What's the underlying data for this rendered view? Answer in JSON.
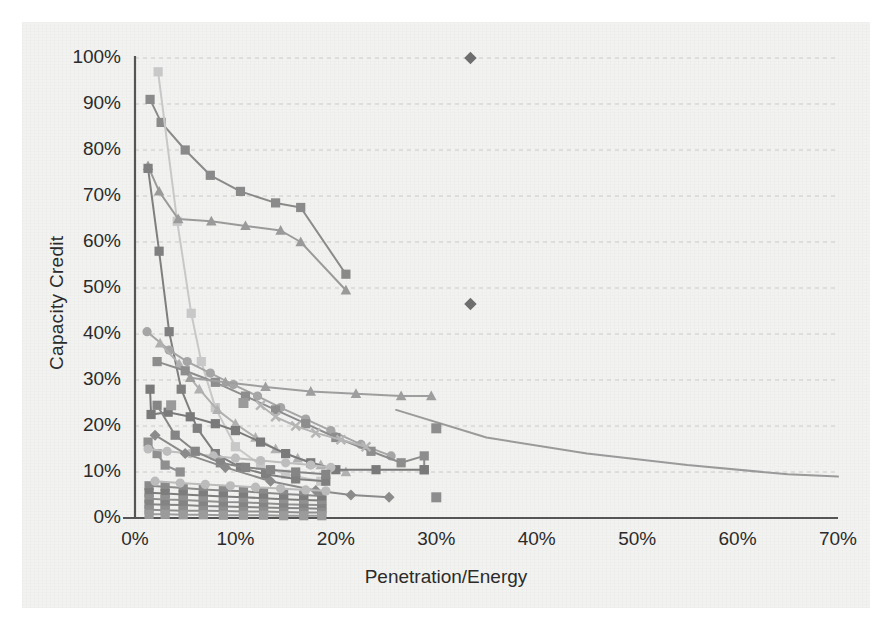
{
  "chart_data": {
    "type": "line",
    "title": "",
    "xlabel": "Penetration/Energy",
    "ylabel": "Capacity Credit",
    "xlim": [
      0,
      70
    ],
    "ylim": [
      0,
      100
    ],
    "xticks": [
      "0%",
      "10%",
      "20%",
      "30%",
      "40%",
      "50%",
      "60%",
      "70%"
    ],
    "yticks": [
      "0%",
      "10%",
      "20%",
      "30%",
      "40%",
      "50%",
      "60%",
      "70%",
      "80%",
      "90%",
      "100%"
    ],
    "grid": "horizontal-dashed",
    "legend": "none",
    "marker_shapes": [
      "square",
      "triangle",
      "circle",
      "diamond",
      "x"
    ],
    "series": [
      {
        "name": "series-01-square-dark",
        "marker": "square",
        "color": "#8a8a8a",
        "points": [
          [
            1.5,
            91.0
          ],
          [
            2.6,
            86.0
          ],
          [
            5.0,
            80.0
          ],
          [
            7.5,
            74.5
          ],
          [
            10.5,
            71.0
          ],
          [
            14.0,
            68.5
          ],
          [
            16.5,
            67.5
          ],
          [
            21.0,
            53.0
          ]
        ]
      },
      {
        "name": "series-02-square-light",
        "marker": "square",
        "color": "#c8c8c8",
        "points": [
          [
            2.3,
            97.0
          ],
          [
            4.2,
            64.5
          ],
          [
            5.6,
            44.5
          ],
          [
            6.6,
            34.0
          ],
          [
            8.0,
            24.0
          ],
          [
            10.0,
            15.5
          ],
          [
            12.5,
            11.5
          ],
          [
            15.0,
            9.5
          ],
          [
            18.5,
            8.0
          ]
        ]
      },
      {
        "name": "series-03-triangle-dark",
        "marker": "triangle",
        "color": "#9a9a9a",
        "points": [
          [
            1.3,
            76.5
          ],
          [
            2.4,
            71.0
          ],
          [
            4.3,
            65.0
          ],
          [
            7.6,
            64.5
          ],
          [
            11.0,
            63.5
          ],
          [
            14.5,
            62.5
          ],
          [
            16.5,
            60.0
          ],
          [
            21.0,
            49.5
          ]
        ]
      },
      {
        "name": "series-04-square-steep",
        "marker": "square",
        "color": "#7f7f7f",
        "points": [
          [
            1.3,
            76.0
          ],
          [
            2.4,
            58.0
          ],
          [
            3.4,
            40.5
          ],
          [
            4.6,
            28.0
          ],
          [
            6.2,
            19.5
          ],
          [
            8.0,
            14.0
          ],
          [
            10.5,
            11.0
          ],
          [
            13.0,
            9.5
          ],
          [
            16.0,
            8.5
          ],
          [
            19.0,
            8.0
          ]
        ]
      },
      {
        "name": "series-05-circle-gray",
        "marker": "circle",
        "color": "#a5a5a5",
        "points": [
          [
            1.2,
            40.5
          ],
          [
            3.4,
            36.5
          ],
          [
            5.2,
            34.0
          ],
          [
            7.5,
            31.5
          ],
          [
            9.8,
            29.0
          ],
          [
            12.2,
            26.5
          ],
          [
            14.5,
            24.0
          ],
          [
            17.0,
            21.5
          ],
          [
            19.5,
            19.0
          ],
          [
            22.5,
            16.0
          ],
          [
            25.5,
            13.5
          ]
        ]
      },
      {
        "name": "series-06-triangle-mid",
        "marker": "triangle",
        "color": "#b0b0b0",
        "points": [
          [
            2.5,
            38.0
          ],
          [
            4.4,
            33.5
          ],
          [
            6.4,
            28.0
          ],
          [
            8.2,
            23.5
          ],
          [
            10.0,
            20.5
          ],
          [
            12.0,
            17.5
          ],
          [
            14.0,
            15.0
          ],
          [
            16.2,
            13.0
          ],
          [
            18.5,
            11.5
          ],
          [
            21.0,
            10.0
          ]
        ]
      },
      {
        "name": "series-07-square-mid",
        "marker": "square",
        "color": "#8d8d8d",
        "points": [
          [
            2.2,
            34.0
          ],
          [
            5.0,
            32.0
          ],
          [
            8.0,
            29.5
          ],
          [
            11.0,
            26.5
          ],
          [
            14.0,
            23.5
          ],
          [
            17.0,
            20.5
          ],
          [
            20.0,
            17.5
          ],
          [
            23.5,
            14.5
          ],
          [
            26.5,
            12.0
          ],
          [
            28.8,
            13.5
          ],
          [
            28.8,
            10.5
          ]
        ]
      },
      {
        "name": "series-08-square-steepdrop",
        "marker": "square",
        "color": "#7a7a7a",
        "points": [
          [
            1.5,
            28.0
          ],
          [
            1.6,
            22.5
          ],
          [
            3.3,
            23.0
          ],
          [
            5.5,
            22.0
          ],
          [
            8.0,
            20.5
          ],
          [
            10.0,
            19.0
          ],
          [
            12.5,
            16.5
          ],
          [
            15.0,
            14.0
          ],
          [
            17.5,
            12.0
          ],
          [
            20.0,
            10.5
          ],
          [
            24.0,
            10.5
          ],
          [
            28.8,
            10.5
          ]
        ]
      },
      {
        "name": "series-09-short-square",
        "marker": "square",
        "color": "#8f8f8f",
        "points": [
          [
            1.3,
            16.5
          ],
          [
            2.2,
            14.0
          ],
          [
            3.0,
            11.5
          ],
          [
            4.5,
            10.0
          ]
        ]
      },
      {
        "name": "series-10-circle-light",
        "marker": "circle",
        "color": "#bdbdbd",
        "points": [
          [
            1.3,
            15.0
          ],
          [
            3.2,
            14.5
          ],
          [
            5.5,
            14.0
          ],
          [
            7.8,
            13.5
          ],
          [
            10.0,
            13.0
          ],
          [
            12.5,
            12.5
          ],
          [
            15.0,
            12.0
          ],
          [
            17.5,
            11.5
          ],
          [
            19.5,
            11.0
          ]
        ]
      },
      {
        "name": "series-11-square-flat",
        "marker": "square",
        "color": "#858585",
        "points": [
          [
            2.2,
            24.5
          ],
          [
            4.0,
            18.0
          ],
          [
            6.0,
            14.5
          ],
          [
            8.5,
            12.0
          ],
          [
            11.0,
            11.0
          ],
          [
            13.5,
            10.5
          ],
          [
            16.0,
            10.0
          ],
          [
            19.0,
            9.5
          ]
        ]
      },
      {
        "name": "series-12-triangle-long",
        "marker": "triangle",
        "color": "#9e9e9e",
        "points": [
          [
            5.5,
            30.5
          ],
          [
            9.0,
            29.5
          ],
          [
            13.0,
            28.5
          ],
          [
            17.5,
            27.5
          ],
          [
            22.0,
            27.0
          ],
          [
            26.5,
            26.5
          ],
          [
            29.5,
            26.5
          ]
        ]
      },
      {
        "name": "series-13-line-long-tail",
        "marker": "none",
        "color": "#9a9a9a",
        "points": [
          [
            26.0,
            23.5
          ],
          [
            35.0,
            17.5
          ],
          [
            45.0,
            14.0
          ],
          [
            55.0,
            11.5
          ],
          [
            65.0,
            9.5
          ],
          [
            70.0,
            9.0
          ]
        ]
      },
      {
        "name": "series-14-diamond-mid",
        "marker": "diamond",
        "color": "#8b8b8b",
        "points": [
          [
            2.0,
            18.0
          ],
          [
            5.0,
            14.0
          ],
          [
            9.0,
            11.0
          ],
          [
            13.5,
            8.0
          ],
          [
            18.0,
            6.0
          ],
          [
            21.5,
            5.0
          ],
          [
            25.3,
            4.5
          ]
        ]
      },
      {
        "name": "series-15-dense-a",
        "marker": "square",
        "color": "#8a8a8a",
        "points": [
          [
            1.4,
            7.0
          ],
          [
            3.0,
            6.8
          ],
          [
            4.8,
            6.5
          ],
          [
            6.8,
            6.2
          ],
          [
            8.8,
            6.0
          ],
          [
            10.8,
            5.8
          ],
          [
            12.8,
            5.5
          ],
          [
            14.8,
            5.2
          ],
          [
            16.8,
            5.0
          ],
          [
            18.6,
            4.8
          ]
        ]
      },
      {
        "name": "series-16-dense-b",
        "marker": "square",
        "color": "#7d7d7d",
        "points": [
          [
            1.4,
            5.5
          ],
          [
            3.0,
            5.3
          ],
          [
            4.8,
            5.1
          ],
          [
            6.8,
            4.9
          ],
          [
            8.8,
            4.7
          ],
          [
            10.8,
            4.5
          ],
          [
            12.8,
            4.3
          ],
          [
            14.8,
            4.1
          ],
          [
            16.8,
            3.9
          ],
          [
            18.6,
            3.8
          ]
        ]
      },
      {
        "name": "series-17-dense-c",
        "marker": "square",
        "color": "#909090",
        "points": [
          [
            1.4,
            4.2
          ],
          [
            3.0,
            4.0
          ],
          [
            4.8,
            3.9
          ],
          [
            6.8,
            3.7
          ],
          [
            8.8,
            3.5
          ],
          [
            10.8,
            3.4
          ],
          [
            12.8,
            3.2
          ],
          [
            14.8,
            3.0
          ],
          [
            16.8,
            2.9
          ],
          [
            18.6,
            2.8
          ]
        ]
      },
      {
        "name": "series-18-dense-d",
        "marker": "square",
        "color": "#848484",
        "points": [
          [
            1.4,
            3.0
          ],
          [
            3.0,
            2.9
          ],
          [
            4.8,
            2.8
          ],
          [
            6.8,
            2.6
          ],
          [
            8.8,
            2.5
          ],
          [
            10.8,
            2.4
          ],
          [
            12.8,
            2.3
          ],
          [
            14.8,
            2.2
          ],
          [
            16.8,
            2.1
          ],
          [
            18.6,
            2.0
          ]
        ]
      },
      {
        "name": "series-19-dense-e",
        "marker": "square",
        "color": "#8e8e8e",
        "points": [
          [
            1.4,
            1.8
          ],
          [
            3.0,
            1.7
          ],
          [
            4.8,
            1.6
          ],
          [
            6.8,
            1.6
          ],
          [
            8.8,
            1.5
          ],
          [
            10.8,
            1.4
          ],
          [
            12.8,
            1.4
          ],
          [
            14.8,
            1.3
          ],
          [
            16.8,
            1.2
          ],
          [
            18.6,
            1.2
          ]
        ]
      },
      {
        "name": "series-20-dense-f",
        "marker": "square",
        "color": "#9b9b9b",
        "points": [
          [
            1.4,
            0.8
          ],
          [
            3.0,
            0.8
          ],
          [
            4.8,
            0.7
          ],
          [
            6.8,
            0.7
          ],
          [
            8.8,
            0.6
          ],
          [
            10.8,
            0.6
          ],
          [
            12.8,
            0.6
          ],
          [
            14.8,
            0.5
          ],
          [
            16.8,
            0.5
          ],
          [
            18.6,
            0.5
          ]
        ]
      },
      {
        "name": "series-21-dense-g",
        "marker": "circle",
        "color": "#bbbbbb",
        "points": [
          [
            2.0,
            8.0
          ],
          [
            4.5,
            7.6
          ],
          [
            7.0,
            7.3
          ],
          [
            9.5,
            7.0
          ],
          [
            12.0,
            6.7
          ],
          [
            14.5,
            6.4
          ],
          [
            17.0,
            6.1
          ],
          [
            19.0,
            5.9
          ]
        ]
      },
      {
        "name": "series-22-x-markers",
        "marker": "x",
        "color": "#b5b5b5",
        "points": [
          [
            12.5,
            24.5
          ],
          [
            14.0,
            22.0
          ],
          [
            16.0,
            20.0
          ],
          [
            18.0,
            18.5
          ],
          [
            20.5,
            17.0
          ],
          [
            23.0,
            15.5
          ]
        ]
      }
    ],
    "isolated_points": [
      {
        "name": "outlier-top-diamond",
        "marker": "diamond",
        "color": "#6e6e6e",
        "x": 33.4,
        "y": 100.0
      },
      {
        "name": "outlier-mid-diamond",
        "marker": "diamond",
        "color": "#6e6e6e",
        "x": 33.4,
        "y": 46.5
      },
      {
        "name": "isolated-square-a",
        "marker": "square",
        "color": "#8d8d8d",
        "x": 30.0,
        "y": 19.5
      },
      {
        "name": "isolated-square-b",
        "marker": "square",
        "color": "#8d8d8d",
        "x": 30.0,
        "y": 4.5
      },
      {
        "name": "isolated-square-c",
        "marker": "square",
        "color": "#9a9a9a",
        "x": 10.8,
        "y": 25.0
      },
      {
        "name": "isolated-square-d",
        "marker": "square",
        "color": "#9a9a9a",
        "x": 3.6,
        "y": 24.5
      }
    ]
  },
  "axes": {
    "y_title": "Capacity Credit",
    "x_title": "Penetration/Energy"
  },
  "colors": {
    "axis": "#555555",
    "grid": "#c9c4c4",
    "text": "#2b2b2b",
    "paper": "#f2f2f0"
  }
}
